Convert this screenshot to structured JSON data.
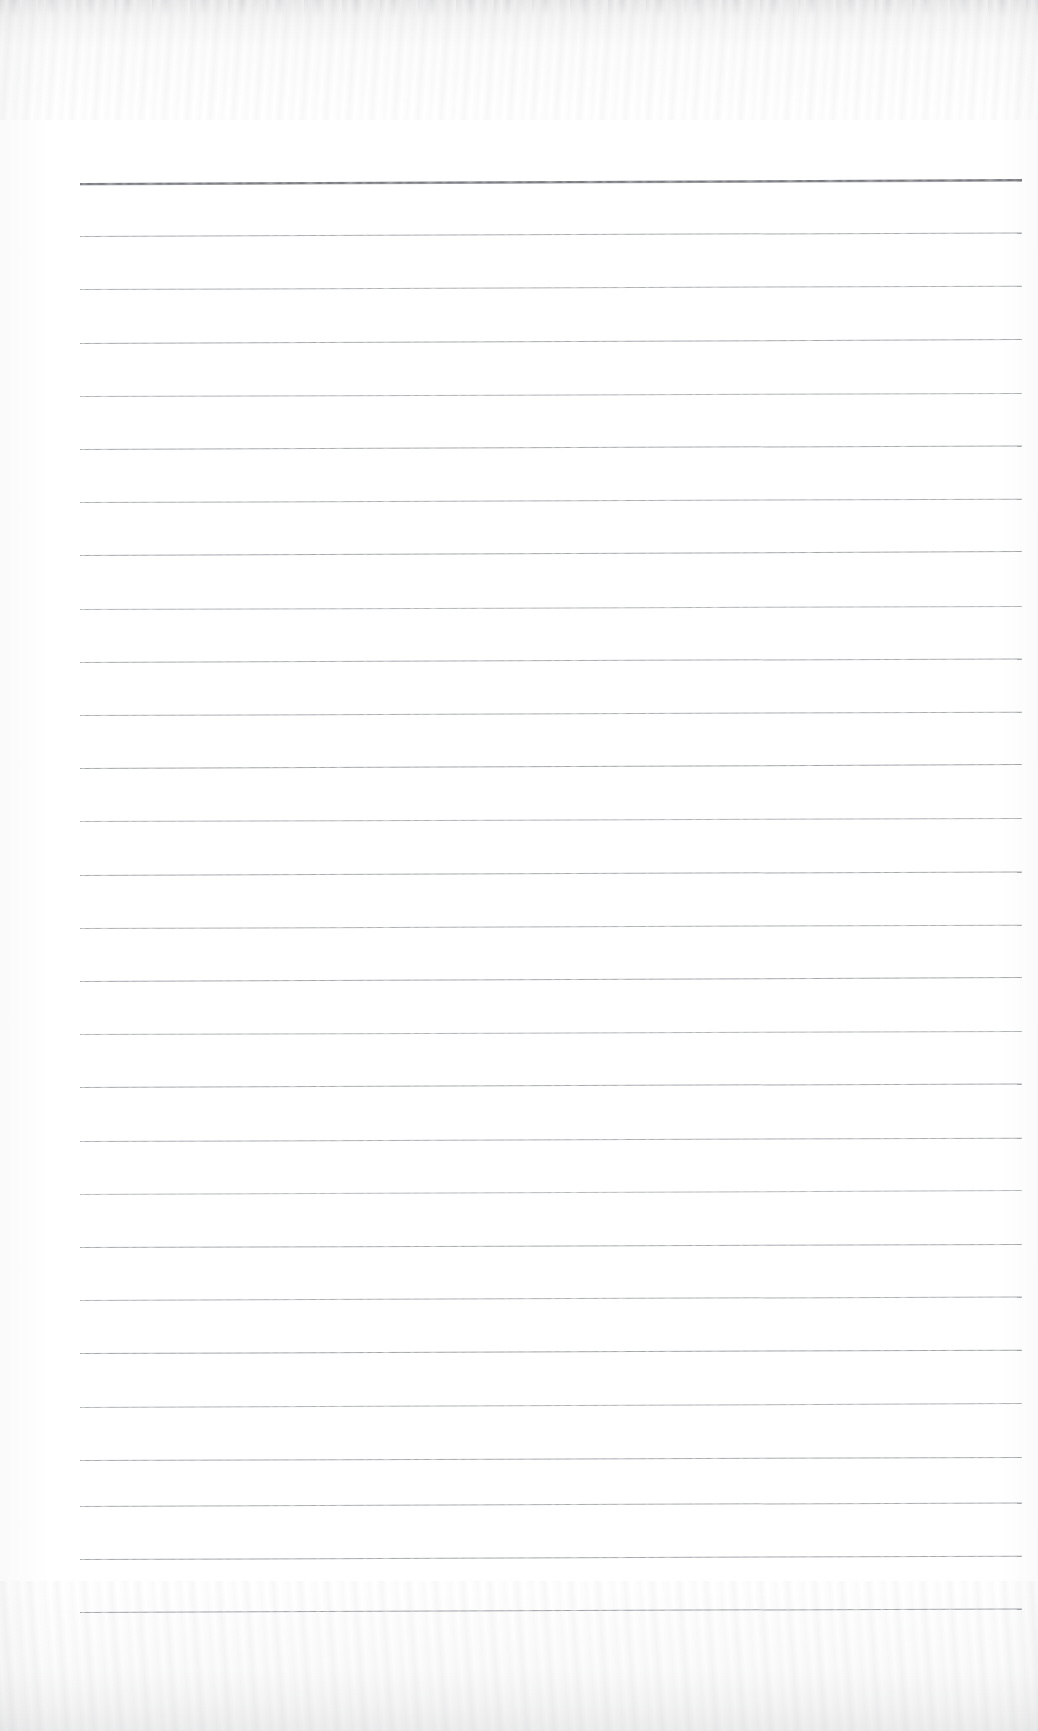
{
  "document": {
    "kind": "scanned-lined-notebook-page",
    "title": "",
    "page_width": 1038,
    "page_height": 1731,
    "background_color": "#ffffff",
    "text_content": "",
    "handwriting_present": false,
    "visible_text": []
  },
  "paper": {
    "rule_color": "#8d8f95",
    "header_rule_color": "#6f7177",
    "edge_shadow_color": "#84868c",
    "line_left_x": 80,
    "line_right_x": 1022,
    "line_width": 942,
    "first_rule_y": 183,
    "rule_spacing": 53.2,
    "skew_degrees": -0.22,
    "header_rule_thickness": 2,
    "rule_thickness": 1,
    "total_rules": 28,
    "margin_top": 183,
    "margin_bottom": 119
  },
  "rules": [
    {
      "index": 0,
      "y": 183,
      "thickness": 2,
      "opacity": 0.95,
      "header": true,
      "skew": -0.24
    },
    {
      "index": 1,
      "y": 236.2,
      "thickness": 1,
      "opacity": 0.78,
      "header": false,
      "skew": -0.22
    },
    {
      "index": 2,
      "y": 289.4,
      "thickness": 1,
      "opacity": 0.74,
      "header": false,
      "skew": -0.2
    },
    {
      "index": 3,
      "y": 342.6,
      "thickness": 1,
      "opacity": 0.8,
      "header": false,
      "skew": -0.24
    },
    {
      "index": 4,
      "y": 395.8,
      "thickness": 1,
      "opacity": 0.72,
      "header": false,
      "skew": -0.18
    },
    {
      "index": 5,
      "y": 449.0,
      "thickness": 1,
      "opacity": 0.8,
      "header": false,
      "skew": -0.22
    },
    {
      "index": 6,
      "y": 502.2,
      "thickness": 1,
      "opacity": 0.75,
      "header": false,
      "skew": -0.2
    },
    {
      "index": 7,
      "y": 555.4,
      "thickness": 1,
      "opacity": 0.82,
      "header": false,
      "skew": -0.24
    },
    {
      "index": 8,
      "y": 608.6,
      "thickness": 1,
      "opacity": 0.7,
      "header": false,
      "skew": -0.18
    },
    {
      "index": 9,
      "y": 661.8,
      "thickness": 1,
      "opacity": 0.78,
      "header": false,
      "skew": -0.22
    },
    {
      "index": 10,
      "y": 715.0,
      "thickness": 1,
      "opacity": 0.76,
      "header": false,
      "skew": -0.2
    },
    {
      "index": 11,
      "y": 768.2,
      "thickness": 1,
      "opacity": 0.84,
      "header": false,
      "skew": -0.24
    },
    {
      "index": 12,
      "y": 821.4,
      "thickness": 1,
      "opacity": 0.72,
      "header": false,
      "skew": -0.18
    },
    {
      "index": 13,
      "y": 874.6,
      "thickness": 1,
      "opacity": 0.8,
      "header": false,
      "skew": -0.22
    },
    {
      "index": 14,
      "y": 927.8,
      "thickness": 1,
      "opacity": 0.74,
      "header": false,
      "skew": -0.2
    },
    {
      "index": 15,
      "y": 981.0,
      "thickness": 1,
      "opacity": 0.82,
      "header": false,
      "skew": -0.24
    },
    {
      "index": 16,
      "y": 1034.2,
      "thickness": 1,
      "opacity": 0.7,
      "header": false,
      "skew": -0.18
    },
    {
      "index": 17,
      "y": 1087.4,
      "thickness": 1,
      "opacity": 0.8,
      "header": false,
      "skew": -0.22
    },
    {
      "index": 18,
      "y": 1140.6,
      "thickness": 1,
      "opacity": 0.76,
      "header": false,
      "skew": -0.2
    },
    {
      "index": 19,
      "y": 1193.8,
      "thickness": 1,
      "opacity": 0.66,
      "header": false,
      "skew": -0.24
    },
    {
      "index": 20,
      "y": 1247.0,
      "thickness": 1,
      "opacity": 0.8,
      "header": false,
      "skew": -0.18
    },
    {
      "index": 21,
      "y": 1300.2,
      "thickness": 1,
      "opacity": 0.74,
      "header": false,
      "skew": -0.22
    },
    {
      "index": 22,
      "y": 1353.4,
      "thickness": 1,
      "opacity": 0.84,
      "header": false,
      "skew": -0.2
    },
    {
      "index": 23,
      "y": 1406.6,
      "thickness": 1,
      "opacity": 0.72,
      "header": false,
      "skew": -0.24
    },
    {
      "index": 24,
      "y": 1459.8,
      "thickness": 1,
      "opacity": 0.8,
      "header": false,
      "skew": -0.18
    },
    {
      "index": 25,
      "y": 1506.0,
      "thickness": 1,
      "opacity": 0.78,
      "header": false,
      "skew": -0.22
    },
    {
      "index": 26,
      "y": 1559.2,
      "thickness": 1,
      "opacity": 0.82,
      "header": false,
      "skew": -0.2
    },
    {
      "index": 27,
      "y": 1612.4,
      "thickness": 1,
      "opacity": 0.86,
      "header": false,
      "skew": -0.22
    }
  ]
}
